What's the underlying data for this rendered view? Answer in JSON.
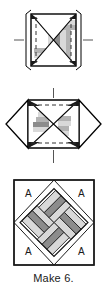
{
  "document": {
    "kind": "quilting-block-instruction",
    "caption": "Make 6."
  },
  "colors": {
    "ink": "#1a1a1a",
    "outline": "#000000",
    "light_strip": "#d9d9d9",
    "medium_strip": "#b3b3b3",
    "dark_strip": "#8c8c8c",
    "background": "#ffffff",
    "dashed_guide": "#333333"
  },
  "steps": [
    {
      "id": "step-1",
      "name": "strip-pieced-square-with-x-seams",
      "description": "Square unit with diagonal X seam lines, vertical strip set, and dashed seam guides at left and right edges with center registration dashes.",
      "guides": {
        "left_dash": true,
        "right_dash": true,
        "center_tick_left": true,
        "center_tick_right": true
      }
    },
    {
      "id": "step-2",
      "name": "folded-unit-with-pressed-points",
      "description": "Unit shown rotated on point with triangular flaps extending left and right, horizontal dashed seam guide through center, and vertical registration ticks top and bottom.",
      "guides": {
        "center_horizontal_dash": true,
        "top_tick": true,
        "bottom_tick": true
      }
    },
    {
      "id": "step-3",
      "name": "finished-pinwheel-block",
      "description": "Completed square block with on-point strip-pieced pinwheel and four corner background triangles labeled A.",
      "corner_labels": [
        "A",
        "A",
        "A",
        "A"
      ]
    }
  ],
  "labels": {
    "corner_a": "A"
  }
}
